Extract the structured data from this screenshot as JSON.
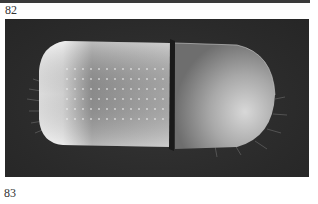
{
  "figures": [
    {
      "number": "82",
      "description": "bottom edge of previous photograph"
    },
    {
      "number": "83",
      "description": "photograph of a cylindrical beetle (dorsal-lateral view) on dark background"
    }
  ],
  "colors": {
    "page_background": "#ffffff",
    "photo_background": "#2e2e2e",
    "label_text": "#333333"
  }
}
